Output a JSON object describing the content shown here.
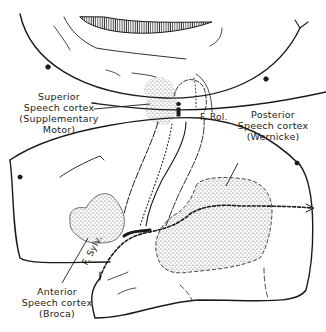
{
  "diagram": {
    "title": "",
    "type": "anatomical illustration",
    "colors": {
      "line": "#1a1a1a",
      "stipple": "#555555",
      "background": "#ffffff"
    }
  },
  "labels": {
    "superior": {
      "line1": "Superior",
      "line2": "Speech cortex",
      "line3": "(Supplementary",
      "line4": "Motor)"
    },
    "posterior": {
      "line1": "Posterior",
      "line2": "Speech cortex",
      "line3": "(Wernicke)"
    },
    "anterior": {
      "line1": "Anterior",
      "line2": "Speech cortex",
      "line3": "(Broca)"
    },
    "fissure_rolandic": "F. Rol.",
    "fissure_sylvian": "F. Sylv."
  }
}
